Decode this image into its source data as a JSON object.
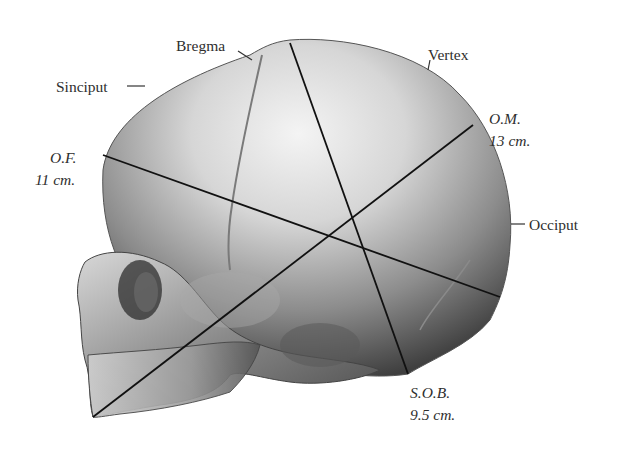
{
  "figure": {
    "labels": {
      "bregma": "Bregma",
      "vertex": "Vertex",
      "sinciput": "Sinciput",
      "occiput": "Occiput"
    },
    "diameters": [
      {
        "id": "of",
        "name": "O.F.",
        "length": "11 cm."
      },
      {
        "id": "om",
        "name": "O.M.",
        "length": "13 cm."
      },
      {
        "id": "sob",
        "name": "S.O.B.",
        "length": "9.5 cm."
      }
    ],
    "colors": {
      "line": "#111111",
      "skull_light": "#e8e8e8",
      "skull_mid": "#9a9a9a",
      "skull_dark": "#3c3c3c"
    }
  }
}
